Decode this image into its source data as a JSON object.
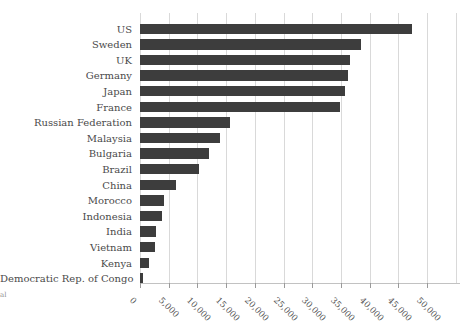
{
  "chart_data": {
    "type": "bar",
    "orientation": "horizontal",
    "title": "",
    "xlabel": "",
    "ylabel": "",
    "categories": [
      "US",
      "Sweden",
      "UK",
      "Germany",
      "Japan",
      "France",
      "Russian Federation",
      "Malaysia",
      "Bulgaria",
      "Brazil",
      "China",
      "Morocco",
      "Indonesia",
      "India",
      "Vietnam",
      "Kenya",
      "Democratic Rep. of Congo"
    ],
    "values": [
      47400,
      38500,
      36600,
      36300,
      35700,
      34800,
      15700,
      13900,
      12100,
      10200,
      6200,
      4200,
      3800,
      2800,
      2600,
      1600,
      450
    ],
    "xlim": [
      0,
      55700
    ],
    "xticks": {
      "values": [
        0,
        5000,
        10000,
        15000,
        20000,
        25000,
        30000,
        35000,
        40000,
        45000,
        50000
      ],
      "labels": [
        "0",
        "5,000",
        "10,000",
        "15,000",
        "20,000",
        "25,000",
        "30,000",
        "35,000",
        "40,000",
        "45,000",
        "50,000"
      ]
    },
    "gridline_values": [
      0,
      5000,
      10000,
      15000,
      20000,
      25000,
      30000,
      35000,
      40000,
      45000,
      50000,
      55000
    ],
    "grid": "vertical",
    "legend": "none",
    "bar_color": "#3d3d3d",
    "gridline_color": "#d9d9d9",
    "axis_line_color": "#c2c2c2",
    "label_color": "#4a4a4a",
    "tick_label_color": "#555555",
    "tick_label_rotation_deg": 45
  },
  "annotations": {
    "left_edge_fragment": "al"
  }
}
